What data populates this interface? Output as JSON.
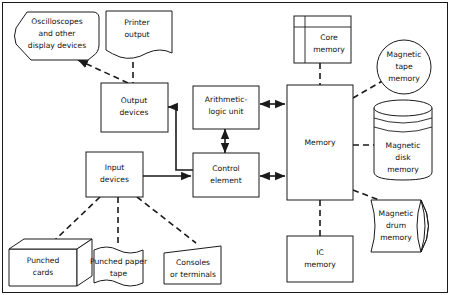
{
  "diagram": {
    "colors": {
      "stroke": "#1a1a1a",
      "background": "#ffffff",
      "text": "#111111"
    },
    "nodes": {
      "oscilloscopes": {
        "label_lines": [
          "Oscilloscopes",
          "and other",
          "display devices"
        ],
        "shape": "hexagon-display"
      },
      "printer_output": {
        "label_lines": [
          "Printer",
          "output"
        ],
        "shape": "document"
      },
      "output_devices": {
        "label_lines": [
          "Output",
          "devices"
        ],
        "shape": "rectangle"
      },
      "input_devices": {
        "label_lines": [
          "Input",
          "devices"
        ],
        "shape": "rectangle"
      },
      "alu": {
        "label_lines": [
          "Arithmetic-",
          "logic unit"
        ],
        "shape": "rectangle"
      },
      "control_element": {
        "label_lines": [
          "Control",
          "element"
        ],
        "shape": "rectangle"
      },
      "memory": {
        "label_lines": [
          "Memory"
        ],
        "shape": "rectangle"
      },
      "core_memory": {
        "label_lines": [
          "Core",
          "memory"
        ],
        "shape": "framed-rectangle"
      },
      "ic_memory": {
        "label_lines": [
          "IC",
          "memory"
        ],
        "shape": "rectangle"
      },
      "magnetic_tape": {
        "label_lines": [
          "Magnetic",
          "tape",
          "memory"
        ],
        "shape": "circle"
      },
      "magnetic_disk": {
        "label_lines": [
          "Magnetic",
          "disk",
          "memory"
        ],
        "shape": "disk-stack"
      },
      "magnetic_drum": {
        "label_lines": [
          "Magnetic",
          "drum",
          "memory"
        ],
        "shape": "horizontal-cylinder"
      },
      "punched_cards": {
        "label_lines": [
          "Punched",
          "cards"
        ],
        "shape": "3d-box"
      },
      "punched_paper_tape": {
        "label_lines": [
          "Punched paper",
          "tape"
        ],
        "shape": "wavy-tape"
      },
      "consoles": {
        "label_lines": [
          "Consoles",
          "or terminals"
        ],
        "shape": "trapezoid"
      }
    },
    "connections": [
      {
        "from": "output_devices",
        "to": "oscilloscopes",
        "style": "dashed",
        "arrow": "to"
      },
      {
        "from": "printer_output",
        "to": "output_devices",
        "style": "dashed",
        "arrow": "none"
      },
      {
        "from": "control_element",
        "to": "output_devices",
        "style": "solid",
        "arrow": "to"
      },
      {
        "from": "input_devices",
        "to": "control_element",
        "style": "solid",
        "arrow": "to"
      },
      {
        "from": "punched_cards",
        "to": "input_devices",
        "style": "dashed",
        "arrow": "none"
      },
      {
        "from": "punched_paper_tape",
        "to": "input_devices",
        "style": "dashed",
        "arrow": "none"
      },
      {
        "from": "consoles",
        "to": "input_devices",
        "style": "dashed",
        "arrow": "none"
      },
      {
        "from": "alu",
        "to": "control_element",
        "style": "solid",
        "arrow": "both"
      },
      {
        "from": "alu",
        "to": "memory",
        "style": "solid",
        "arrow": "both"
      },
      {
        "from": "control_element",
        "to": "memory",
        "style": "solid",
        "arrow": "both"
      },
      {
        "from": "core_memory",
        "to": "memory",
        "style": "dashed",
        "arrow": "none"
      },
      {
        "from": "memory",
        "to": "ic_memory",
        "style": "dashed",
        "arrow": "none"
      },
      {
        "from": "memory",
        "to": "magnetic_tape",
        "style": "dashed",
        "arrow": "none"
      },
      {
        "from": "memory",
        "to": "magnetic_disk",
        "style": "dashed",
        "arrow": "none"
      },
      {
        "from": "memory",
        "to": "magnetic_drum",
        "style": "dashed",
        "arrow": "none"
      }
    ]
  }
}
